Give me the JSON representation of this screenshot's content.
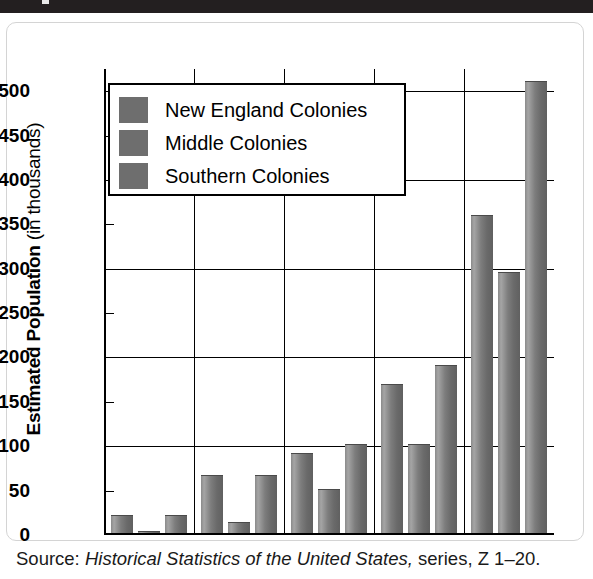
{
  "figure": {
    "y_axis_title_bold": "Estimated Population",
    "y_axis_title_light": "(in thousands)",
    "source_prefix": "Source:",
    "source_title": "Historical Statistics of the United States,",
    "source_suffix": "series, Z 1–20."
  },
  "legend": {
    "items": [
      {
        "label": "New England Colonies",
        "color": "#6e6e6e"
      },
      {
        "label": "Middle Colonies",
        "color": "#6e6e6e"
      },
      {
        "label": "Southern Colonies",
        "color": "#6e6e6e"
      }
    ]
  },
  "chart_data": {
    "type": "bar",
    "title": "",
    "xlabel": "",
    "ylabel": "Estimated Population (in thousands)",
    "categories": [
      "1650",
      "1680",
      "1700",
      "1720",
      "1750"
    ],
    "series": [
      {
        "name": "New England Colonies",
        "values": [
          23,
          68,
          92,
          170,
          360
        ]
      },
      {
        "name": "Middle Colonies",
        "values": [
          5,
          15,
          52,
          102,
          296
        ]
      },
      {
        "name": "Southern Colonies",
        "values": [
          23,
          68,
          103,
          192,
          512
        ]
      }
    ],
    "ylim": [
      0,
      525
    ],
    "yticks": [
      0,
      50,
      100,
      150,
      200,
      250,
      300,
      350,
      400,
      450,
      500
    ],
    "ytick_labels": [
      "0",
      "50",
      "100",
      "150",
      "200",
      "250",
      "300",
      "350",
      "400",
      "450",
      "500"
    ],
    "grid": true,
    "grid_axis": "y",
    "legend_position": "upper left",
    "bar_color": "#7d7d7d",
    "source": "Source: Historical Statistics of the United States, series, Z 1–20."
  }
}
